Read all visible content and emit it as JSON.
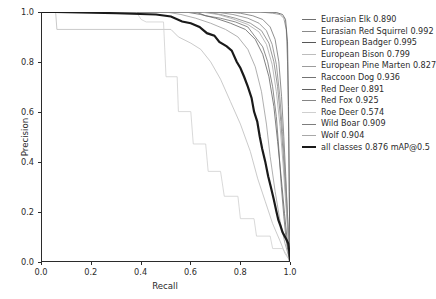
{
  "chart_data": {
    "type": "line",
    "title": "",
    "xlabel": "Recall",
    "ylabel": "Precision",
    "xlim": [
      0.0,
      1.0
    ],
    "ylim": [
      0.0,
      1.0
    ],
    "xticks": [
      "0.0",
      "0.2",
      "0.4",
      "0.6",
      "0.8",
      "1.0"
    ],
    "yticks": [
      "0.0",
      "0.2",
      "0.4",
      "0.6",
      "0.8",
      "1.0"
    ],
    "xtick_values": [
      0.0,
      0.2,
      0.4,
      0.6,
      0.8,
      1.0
    ],
    "ytick_values": [
      0.0,
      0.2,
      0.4,
      0.6,
      0.8,
      1.0
    ],
    "grid": false,
    "legend_position": "right",
    "metric": "mAP@0.5",
    "series": [
      {
        "name": "Eurasian Elk",
        "label": "Eurasian Elk 0.890",
        "ap": 0.89,
        "color": "#6f6f6f",
        "width": 0.8,
        "points": [
          [
            0.0,
            1.0
          ],
          [
            0.62,
            1.0
          ],
          [
            0.66,
            0.985
          ],
          [
            0.72,
            0.975
          ],
          [
            0.78,
            0.96
          ],
          [
            0.83,
            0.94
          ],
          [
            0.86,
            0.9
          ],
          [
            0.89,
            0.86
          ],
          [
            0.91,
            0.8
          ],
          [
            0.93,
            0.7
          ],
          [
            0.945,
            0.58
          ],
          [
            0.955,
            0.45
          ],
          [
            0.965,
            0.3
          ],
          [
            0.975,
            0.18
          ],
          [
            0.985,
            0.08
          ],
          [
            0.995,
            0.02
          ],
          [
            1.0,
            0.0
          ]
        ]
      },
      {
        "name": "Eurasian Red Squirrel",
        "label": "Eurasian Red Squirrel 0.992",
        "ap": 0.992,
        "color": "#8a8a8a",
        "width": 0.8,
        "points": [
          [
            0.0,
            1.0
          ],
          [
            0.88,
            1.0
          ],
          [
            0.93,
            0.995
          ],
          [
            0.96,
            0.99
          ],
          [
            0.975,
            0.975
          ],
          [
            0.985,
            0.93
          ],
          [
            0.99,
            0.8
          ],
          [
            0.995,
            0.5
          ],
          [
            0.998,
            0.18
          ],
          [
            1.0,
            0.0
          ]
        ]
      },
      {
        "name": "European Badger",
        "label": "European Badger 0.995",
        "ap": 0.995,
        "color": "#575757",
        "width": 0.8,
        "points": [
          [
            0.0,
            1.0
          ],
          [
            0.9,
            1.0
          ],
          [
            0.945,
            0.998
          ],
          [
            0.97,
            0.99
          ],
          [
            0.982,
            0.97
          ],
          [
            0.99,
            0.88
          ],
          [
            0.994,
            0.62
          ],
          [
            0.997,
            0.28
          ],
          [
            1.0,
            0.0
          ]
        ]
      },
      {
        "name": "European Bison",
        "label": "European Bison 0.799",
        "ap": 0.799,
        "color": "#bdbdbd",
        "width": 0.8,
        "points": [
          [
            0.0,
            1.0
          ],
          [
            0.055,
            1.0
          ],
          [
            0.06,
            0.93
          ],
          [
            0.52,
            0.93
          ],
          [
            0.55,
            0.9
          ],
          [
            0.6,
            0.875
          ],
          [
            0.64,
            0.85
          ],
          [
            0.68,
            0.8
          ],
          [
            0.72,
            0.73
          ],
          [
            0.76,
            0.64
          ],
          [
            0.8,
            0.55
          ],
          [
            0.84,
            0.44
          ],
          [
            0.87,
            0.33
          ],
          [
            0.9,
            0.24
          ],
          [
            0.93,
            0.15
          ],
          [
            0.96,
            0.08
          ],
          [
            0.98,
            0.03
          ],
          [
            1.0,
            0.0
          ]
        ]
      },
      {
        "name": "European Pine Marten",
        "label": "European Pine Marten 0.827",
        "ap": 0.827,
        "color": "#9c9c9c",
        "width": 0.8,
        "points": [
          [
            0.0,
            1.0
          ],
          [
            0.5,
            1.0
          ],
          [
            0.56,
            0.99
          ],
          [
            0.62,
            0.975
          ],
          [
            0.68,
            0.955
          ],
          [
            0.74,
            0.93
          ],
          [
            0.79,
            0.9
          ],
          [
            0.83,
            0.85
          ],
          [
            0.86,
            0.78
          ],
          [
            0.885,
            0.68
          ],
          [
            0.905,
            0.55
          ],
          [
            0.92,
            0.42
          ],
          [
            0.94,
            0.28
          ],
          [
            0.96,
            0.16
          ],
          [
            0.98,
            0.07
          ],
          [
            1.0,
            0.0
          ]
        ]
      },
      {
        "name": "Raccoon Dog",
        "label": "Raccoon Dog 0.936",
        "ap": 0.936,
        "color": "#737373",
        "width": 0.8,
        "points": [
          [
            0.0,
            1.0
          ],
          [
            0.75,
            1.0
          ],
          [
            0.8,
            0.995
          ],
          [
            0.85,
            0.985
          ],
          [
            0.89,
            0.97
          ],
          [
            0.92,
            0.94
          ],
          [
            0.94,
            0.89
          ],
          [
            0.955,
            0.8
          ],
          [
            0.966,
            0.66
          ],
          [
            0.975,
            0.5
          ],
          [
            0.983,
            0.34
          ],
          [
            0.99,
            0.18
          ],
          [
            0.996,
            0.06
          ],
          [
            1.0,
            0.0
          ]
        ]
      },
      {
        "name": "Red Deer",
        "label": "Red Deer 0.891",
        "ap": 0.891,
        "color": "#616161",
        "width": 0.8,
        "points": [
          [
            0.0,
            1.0
          ],
          [
            0.58,
            1.0
          ],
          [
            0.64,
            0.99
          ],
          [
            0.7,
            0.975
          ],
          [
            0.76,
            0.955
          ],
          [
            0.82,
            0.93
          ],
          [
            0.86,
            0.89
          ],
          [
            0.89,
            0.83
          ],
          [
            0.915,
            0.74
          ],
          [
            0.935,
            0.62
          ],
          [
            0.95,
            0.48
          ],
          [
            0.965,
            0.33
          ],
          [
            0.978,
            0.19
          ],
          [
            0.99,
            0.07
          ],
          [
            1.0,
            0.0
          ]
        ]
      },
      {
        "name": "Red Fox",
        "label": "Red Fox 0.925",
        "ap": 0.925,
        "color": "#858585",
        "width": 0.8,
        "points": [
          [
            0.0,
            1.0
          ],
          [
            0.7,
            1.0
          ],
          [
            0.77,
            0.99
          ],
          [
            0.83,
            0.975
          ],
          [
            0.875,
            0.955
          ],
          [
            0.905,
            0.925
          ],
          [
            0.928,
            0.87
          ],
          [
            0.945,
            0.79
          ],
          [
            0.958,
            0.67
          ],
          [
            0.97,
            0.52
          ],
          [
            0.98,
            0.36
          ],
          [
            0.99,
            0.19
          ],
          [
            0.997,
            0.05
          ],
          [
            1.0,
            0.0
          ]
        ]
      },
      {
        "name": "Roe Deer",
        "label": "Roe Deer 0.574",
        "ap": 0.574,
        "color": "#cfcfcf",
        "width": 0.8,
        "points": [
          [
            0.0,
            1.0
          ],
          [
            0.38,
            1.0
          ],
          [
            0.4,
            0.97
          ],
          [
            0.42,
            0.96
          ],
          [
            0.49,
            0.96
          ],
          [
            0.5,
            0.74
          ],
          [
            0.545,
            0.74
          ],
          [
            0.55,
            0.6
          ],
          [
            0.6,
            0.6
          ],
          [
            0.61,
            0.47
          ],
          [
            0.66,
            0.47
          ],
          [
            0.67,
            0.36
          ],
          [
            0.72,
            0.36
          ],
          [
            0.735,
            0.26
          ],
          [
            0.79,
            0.26
          ],
          [
            0.8,
            0.17
          ],
          [
            0.855,
            0.17
          ],
          [
            0.865,
            0.1
          ],
          [
            0.92,
            0.1
          ],
          [
            0.93,
            0.05
          ],
          [
            0.97,
            0.05
          ],
          [
            0.99,
            0.02
          ],
          [
            1.0,
            0.0
          ]
        ]
      },
      {
        "name": "Wild Boar",
        "label": "Wild Boar 0.909",
        "ap": 0.909,
        "color": "#7d7d7d",
        "width": 0.8,
        "points": [
          [
            0.0,
            1.0
          ],
          [
            0.66,
            1.0
          ],
          [
            0.72,
            0.99
          ],
          [
            0.78,
            0.975
          ],
          [
            0.84,
            0.955
          ],
          [
            0.885,
            0.925
          ],
          [
            0.915,
            0.875
          ],
          [
            0.935,
            0.8
          ],
          [
            0.95,
            0.7
          ],
          [
            0.963,
            0.56
          ],
          [
            0.974,
            0.41
          ],
          [
            0.984,
            0.25
          ],
          [
            0.993,
            0.1
          ],
          [
            1.0,
            0.0
          ]
        ]
      },
      {
        "name": "Wolf",
        "label": "Wolf 0.904",
        "ap": 0.904,
        "color": "#a8a8a8",
        "width": 0.8,
        "points": [
          [
            0.0,
            1.0
          ],
          [
            0.64,
            1.0
          ],
          [
            0.71,
            0.99
          ],
          [
            0.77,
            0.972
          ],
          [
            0.83,
            0.95
          ],
          [
            0.875,
            0.92
          ],
          [
            0.905,
            0.87
          ],
          [
            0.928,
            0.79
          ],
          [
            0.945,
            0.68
          ],
          [
            0.96,
            0.54
          ],
          [
            0.972,
            0.39
          ],
          [
            0.983,
            0.23
          ],
          [
            0.993,
            0.09
          ],
          [
            1.0,
            0.0
          ]
        ]
      },
      {
        "name": "all classes",
        "label": "all classes 0.876 mAP@0.5",
        "ap": 0.876,
        "color": "#1a1a1a",
        "width": 2.2,
        "points": [
          [
            0.0,
            1.0
          ],
          [
            0.055,
            1.0
          ],
          [
            0.3,
            0.995
          ],
          [
            0.46,
            0.99
          ],
          [
            0.52,
            0.982
          ],
          [
            0.565,
            0.962
          ],
          [
            0.6,
            0.955
          ],
          [
            0.635,
            0.94
          ],
          [
            0.665,
            0.915
          ],
          [
            0.695,
            0.905
          ],
          [
            0.715,
            0.88
          ],
          [
            0.745,
            0.862
          ],
          [
            0.765,
            0.845
          ],
          [
            0.785,
            0.8
          ],
          [
            0.8,
            0.775
          ],
          [
            0.815,
            0.74
          ],
          [
            0.83,
            0.7
          ],
          [
            0.845,
            0.655
          ],
          [
            0.855,
            0.6
          ],
          [
            0.868,
            0.56
          ],
          [
            0.878,
            0.5
          ],
          [
            0.888,
            0.45
          ],
          [
            0.9,
            0.4
          ],
          [
            0.912,
            0.34
          ],
          [
            0.922,
            0.3
          ],
          [
            0.934,
            0.25
          ],
          [
            0.945,
            0.2
          ],
          [
            0.953,
            0.165
          ],
          [
            0.962,
            0.14
          ],
          [
            0.97,
            0.115
          ],
          [
            0.978,
            0.1
          ],
          [
            0.986,
            0.085
          ],
          [
            0.993,
            0.07
          ],
          [
            0.997,
            0.04
          ],
          [
            1.0,
            0.0
          ]
        ]
      }
    ]
  }
}
